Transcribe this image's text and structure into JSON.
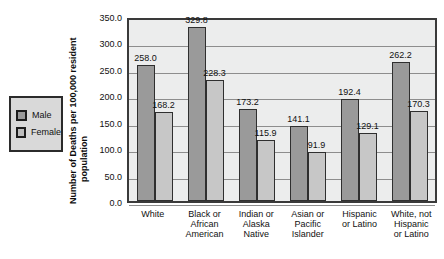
{
  "chart_data": {
    "type": "bar",
    "title": "",
    "xlabel": "",
    "ylabel": "Number of Deaths per 100,000 resident population",
    "ylabel_lines": [
      "Number of Deaths per 100,000 resident",
      "population"
    ],
    "ylim": [
      0,
      350
    ],
    "ytick_labels": [
      "350.0",
      "300.0",
      "250.0",
      "200.0",
      "150.0",
      "100.0",
      "50.0",
      "0.0"
    ],
    "ytick_values": [
      350,
      300,
      250,
      200,
      150,
      100,
      50,
      0
    ],
    "grid": true,
    "legend_position": "left-outside",
    "categories": [
      "White",
      "Black or African American",
      "Indian or Alaska Native",
      "Asian or Pacific Islander",
      "Hispanic or Latino",
      "White, not Hispanic or Latino"
    ],
    "category_lines": [
      [
        "White"
      ],
      [
        "Black or",
        "African",
        "American"
      ],
      [
        "Indian or",
        "Alaska",
        "Native"
      ],
      [
        "Asian or",
        "Pacific",
        "Islander"
      ],
      [
        "Hispanic",
        "or Latino"
      ],
      [
        "White, not",
        "Hispanic",
        "or Latino"
      ]
    ],
    "series": [
      {
        "name": "Male",
        "color": "#9a9a9a",
        "values": [
          258.0,
          329.8,
          173.2,
          141.1,
          192.4,
          262.2
        ],
        "labels": [
          "258.0",
          "329.8",
          "173.2",
          "141.1",
          "192.4",
          "262.2"
        ]
      },
      {
        "name": "Female",
        "color": "#c7c7c7",
        "values": [
          168.2,
          228.3,
          115.9,
          91.9,
          129.1,
          170.3
        ],
        "labels": [
          "168.2",
          "228.3",
          "115.9",
          "91.9",
          "129.1",
          "170.3"
        ]
      }
    ]
  },
  "legend": {
    "items": [
      {
        "label": "Male",
        "color": "#9a9a9a"
      },
      {
        "label": "Female",
        "color": "#c7c7c7"
      }
    ]
  },
  "colors": {
    "male": "#9a9a9a",
    "female": "#c7c7c7",
    "plot_background": "#eceded",
    "legend_background": "#d9d9d9",
    "axis": "#3a3a3a",
    "gridline": "#8d8d8d"
  }
}
